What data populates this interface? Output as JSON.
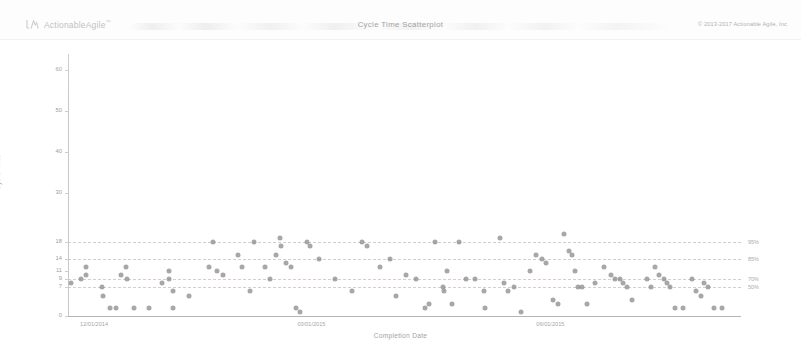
{
  "header": {
    "brand_name": "ActionableAgile",
    "brand_tm": "™",
    "brand_icon": "actionableagile-logo-icon",
    "title": "Cycle Time Scatterplot",
    "copyright": "© 2013-2017 Actionable Agile, Inc"
  },
  "chart_data": {
    "type": "scatter",
    "title": "Cycle Time Scatterplot",
    "xlabel": "Completion Date",
    "ylabel": "Cycle Time",
    "grid": true,
    "legend_position": "right-axis-labels",
    "ylim": [
      0,
      64
    ],
    "yticks": [
      0,
      7,
      9,
      11,
      14,
      18,
      30,
      40,
      50,
      60
    ],
    "ytick_labels": [
      "0",
      "7",
      "9",
      "11",
      "14",
      "18",
      "30",
      "40",
      "50",
      "60"
    ],
    "xlim": [
      "12/01/2014",
      "08/15/2015"
    ],
    "xticks": [
      "12/01/2014",
      "03/01/2015",
      "06/01/2015"
    ],
    "xtick_labels": [
      "12/01/2014",
      "03/01/2015",
      "06/01/2015"
    ],
    "percentile_lines": [
      {
        "label": "95%",
        "value": 18
      },
      {
        "label": "85%",
        "value": 14
      },
      {
        "label": "70%",
        "value": 9
      },
      {
        "label": "50%",
        "value": 7
      }
    ],
    "point_color": "#8e8e8e",
    "points": [
      {
        "x": 3,
        "y": 8
      },
      {
        "x": 12,
        "y": 9
      },
      {
        "x": 16,
        "y": 12
      },
      {
        "x": 16,
        "y": 10
      },
      {
        "x": 30,
        "y": 7
      },
      {
        "x": 31,
        "y": 5
      },
      {
        "x": 37,
        "y": 2
      },
      {
        "x": 43,
        "y": 2
      },
      {
        "x": 47,
        "y": 10
      },
      {
        "x": 52,
        "y": 12
      },
      {
        "x": 53,
        "y": 9
      },
      {
        "x": 59,
        "y": 2
      },
      {
        "x": 72,
        "y": 2
      },
      {
        "x": 84,
        "y": 8
      },
      {
        "x": 90,
        "y": 11
      },
      {
        "x": 90,
        "y": 9
      },
      {
        "x": 94,
        "y": 6
      },
      {
        "x": 94,
        "y": 2
      },
      {
        "x": 108,
        "y": 5
      },
      {
        "x": 126,
        "y": 12
      },
      {
        "x": 129,
        "y": 18
      },
      {
        "x": 133,
        "y": 11
      },
      {
        "x": 138,
        "y": 10
      },
      {
        "x": 152,
        "y": 15
      },
      {
        "x": 155,
        "y": 12
      },
      {
        "x": 162,
        "y": 6
      },
      {
        "x": 166,
        "y": 18
      },
      {
        "x": 176,
        "y": 12
      },
      {
        "x": 180,
        "y": 9
      },
      {
        "x": 185,
        "y": 15
      },
      {
        "x": 189,
        "y": 19
      },
      {
        "x": 190,
        "y": 17
      },
      {
        "x": 194,
        "y": 13
      },
      {
        "x": 199,
        "y": 12
      },
      {
        "x": 203,
        "y": 2
      },
      {
        "x": 207,
        "y": 1
      },
      {
        "x": 213,
        "y": 18
      },
      {
        "x": 216,
        "y": 17
      },
      {
        "x": 224,
        "y": 14
      },
      {
        "x": 238,
        "y": 9
      },
      {
        "x": 253,
        "y": 6
      },
      {
        "x": 262,
        "y": 18
      },
      {
        "x": 267,
        "y": 17
      },
      {
        "x": 278,
        "y": 12
      },
      {
        "x": 287,
        "y": 14
      },
      {
        "x": 292,
        "y": 5
      },
      {
        "x": 301,
        "y": 10
      },
      {
        "x": 310,
        "y": 9
      },
      {
        "x": 318,
        "y": 2
      },
      {
        "x": 322,
        "y": 3
      },
      {
        "x": 327,
        "y": 18
      },
      {
        "x": 334,
        "y": 7
      },
      {
        "x": 335,
        "y": 6
      },
      {
        "x": 338,
        "y": 11
      },
      {
        "x": 342,
        "y": 3
      },
      {
        "x": 349,
        "y": 18
      },
      {
        "x": 355,
        "y": 9
      },
      {
        "x": 363,
        "y": 9
      },
      {
        "x": 371,
        "y": 6
      },
      {
        "x": 372,
        "y": 2
      },
      {
        "x": 385,
        "y": 19
      },
      {
        "x": 389,
        "y": 8
      },
      {
        "x": 392,
        "y": 6
      },
      {
        "x": 398,
        "y": 7
      },
      {
        "x": 404,
        "y": 1
      },
      {
        "x": 412,
        "y": 11
      },
      {
        "x": 417,
        "y": 15
      },
      {
        "x": 423,
        "y": 14
      },
      {
        "x": 426,
        "y": 13
      },
      {
        "x": 432,
        "y": 4
      },
      {
        "x": 437,
        "y": 3
      },
      {
        "x": 442,
        "y": 20
      },
      {
        "x": 447,
        "y": 16
      },
      {
        "x": 449,
        "y": 15
      },
      {
        "x": 452,
        "y": 11
      },
      {
        "x": 455,
        "y": 7
      },
      {
        "x": 458,
        "y": 7
      },
      {
        "x": 463,
        "y": 3
      },
      {
        "x": 470,
        "y": 8
      },
      {
        "x": 478,
        "y": 12
      },
      {
        "x": 484,
        "y": 10
      },
      {
        "x": 488,
        "y": 9
      },
      {
        "x": 492,
        "y": 9
      },
      {
        "x": 495,
        "y": 8
      },
      {
        "x": 498,
        "y": 7
      },
      {
        "x": 503,
        "y": 4
      },
      {
        "x": 516,
        "y": 9
      },
      {
        "x": 520,
        "y": 7
      },
      {
        "x": 523,
        "y": 12
      },
      {
        "x": 527,
        "y": 10
      },
      {
        "x": 531,
        "y": 9
      },
      {
        "x": 534,
        "y": 8
      },
      {
        "x": 537,
        "y": 7
      },
      {
        "x": 541,
        "y": 2
      },
      {
        "x": 548,
        "y": 2
      },
      {
        "x": 556,
        "y": 9
      },
      {
        "x": 560,
        "y": 6
      },
      {
        "x": 564,
        "y": 5
      },
      {
        "x": 567,
        "y": 8
      },
      {
        "x": 571,
        "y": 7
      },
      {
        "x": 576,
        "y": 2
      },
      {
        "x": 583,
        "y": 2
      }
    ]
  }
}
